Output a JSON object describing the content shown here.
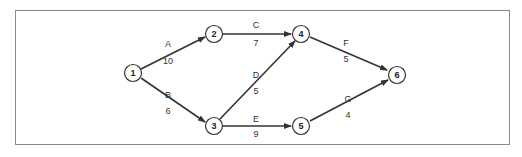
{
  "diagram": {
    "type": "activity-on-arrow network",
    "nodes": [
      {
        "id": "1",
        "label": "1",
        "x": 133,
        "y": 73
      },
      {
        "id": "2",
        "label": "2",
        "x": 214,
        "y": 34
      },
      {
        "id": "3",
        "label": "3",
        "x": 214,
        "y": 126
      },
      {
        "id": "4",
        "label": "4",
        "x": 301,
        "y": 34
      },
      {
        "id": "5",
        "label": "5",
        "x": 301,
        "y": 126
      },
      {
        "id": "6",
        "label": "6",
        "x": 397,
        "y": 75
      }
    ],
    "edges": [
      {
        "from": "1",
        "to": "2",
        "activity": "A",
        "duration": "10"
      },
      {
        "from": "1",
        "to": "3",
        "activity": "B",
        "duration": "6"
      },
      {
        "from": "2",
        "to": "4",
        "activity": "C",
        "duration": "7"
      },
      {
        "from": "3",
        "to": "4",
        "activity": "D",
        "duration": "5"
      },
      {
        "from": "3",
        "to": "5",
        "activity": "E",
        "duration": "9"
      },
      {
        "from": "4",
        "to": "6",
        "activity": "F",
        "duration": "5"
      },
      {
        "from": "5",
        "to": "6",
        "activity": "G",
        "duration": "4"
      }
    ]
  }
}
